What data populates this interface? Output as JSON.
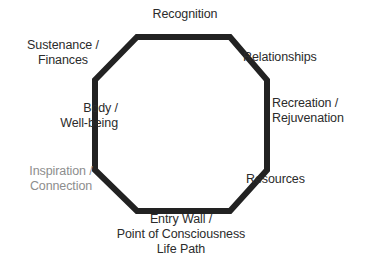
{
  "diagram": {
    "shape": "octagon",
    "stroke_color": "#222222",
    "fill_color": "#ffffff",
    "background_color": "#ffffff",
    "stroke_width_px": 6,
    "labels": [
      {
        "id": "recognition",
        "text": "Recognition",
        "position": "top",
        "align": "center",
        "color": "#2b2b2b"
      },
      {
        "id": "sustenance",
        "text": "Sustenance /\nFinances",
        "position": "top-left",
        "align": "center",
        "color": "#2b2b2b"
      },
      {
        "id": "relationships",
        "text": "Relationships",
        "position": "top-right",
        "align": "left",
        "color": "#2b2b2b"
      },
      {
        "id": "body",
        "text": "Body /\nWell-being",
        "position": "left",
        "align": "right",
        "color": "#2b2b2b"
      },
      {
        "id": "recreation",
        "text": "Recreation /\nRejuvenation",
        "position": "right",
        "align": "left",
        "color": "#2b2b2b"
      },
      {
        "id": "inspiration",
        "text": "Inspiration /\nConnection",
        "position": "bottom-left",
        "align": "center",
        "color": "#8d8d8d"
      },
      {
        "id": "resources",
        "text": "Resources",
        "position": "bottom-right",
        "align": "left",
        "color": "#2b2b2b"
      },
      {
        "id": "entry_wall",
        "text": "Entry Wall /\nPoint of Consciousness\nLife Path",
        "position": "bottom",
        "align": "center",
        "color": "#2b2b2b"
      }
    ]
  },
  "labels_text": {
    "recognition": "Recognition",
    "sustenance_line1": "Sustenance /",
    "sustenance_line2": "Finances",
    "relationships": "Relationships",
    "body_line1": "Body /",
    "body_line2": "Well-being",
    "recreation_line1": "Recreation /",
    "recreation_line2": "Rejuvenation",
    "inspiration_line1": "Inspiration /",
    "inspiration_line2": "Connection",
    "resources": "Resources",
    "entry_line1": "Entry Wall /",
    "entry_line2": "Point of Consciousness",
    "entry_line3": "Life Path"
  }
}
